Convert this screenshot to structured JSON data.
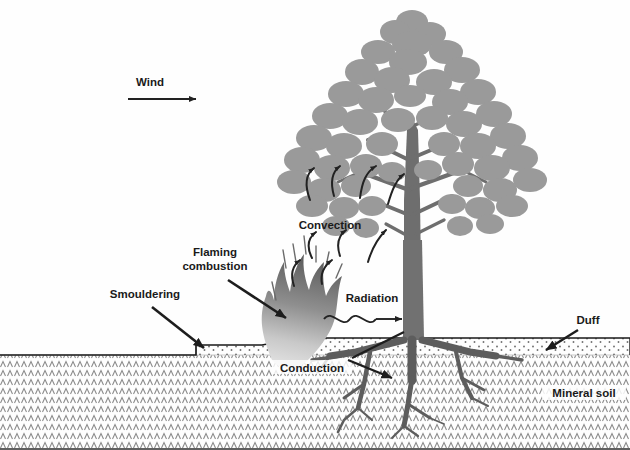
{
  "diagram": {
    "background_color": "#fefefe",
    "labels": {
      "wind": "Wind",
      "convection": "Convection",
      "flaming_combustion_line1": "Flaming",
      "flaming_combustion_line2": "combustion",
      "smouldering": "Smouldering",
      "radiation": "Radiation",
      "conduction": "Conduction",
      "duff": "Duff",
      "mineral_soil": "Mineral soil"
    },
    "colors": {
      "text": "#1a1a1a",
      "arrow": "#222222",
      "canopy_foliage": "#9a9a9a",
      "trunk": "#6e6e6e",
      "roots": "#5d5d5d",
      "flame_dark": "#6b6b6b",
      "flame_light": "#d8d8d8",
      "soil_hatch": "#8c8c8c",
      "duff_dots": "#6f6f6f",
      "ground_line": "#1a1a1a"
    },
    "elements": {
      "wind_arrow": "horizontal-right-arrow",
      "convection_arrows_count": 9,
      "radiation_wave": "sine-wave-right-arrow",
      "flame": "smoke-plume",
      "tree": "broadleaf-tree",
      "soil_layers": [
        "duff",
        "mineral soil"
      ]
    }
  }
}
